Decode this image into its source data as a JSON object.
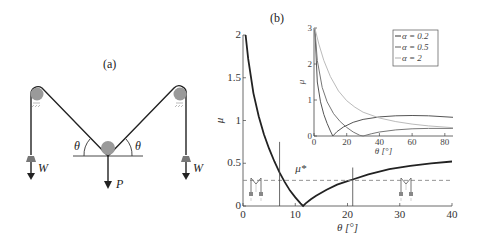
{
  "figure": {
    "panel_a_label": "(a)",
    "panel_b_label": "(b)"
  },
  "diagram_a": {
    "labels": {
      "theta_left": "θ",
      "theta_right": "θ",
      "weight_left": "W",
      "weight_right": "W",
      "load": "P"
    },
    "colors": {
      "pulley": "#9a9a9a",
      "rope": "#222222",
      "weight": "#777777"
    }
  },
  "chart_data": [
    {
      "type": "line",
      "title": "(b)",
      "xlabel": "θ [°]",
      "ylabel": "μ",
      "xlim": [
        0,
        40
      ],
      "ylim": [
        0,
        2
      ],
      "xticks": [
        0,
        10,
        20,
        30,
        40
      ],
      "yticks": [
        0,
        0.5,
        1,
        1.5,
        2
      ],
      "ytick_labels": [
        "0",
        "0.5",
        "1",
        "1.5",
        "2"
      ],
      "grid": false,
      "series": [
        {
          "name": "μ(θ)",
          "color": "#222222",
          "x": [
            0.5,
            1,
            2,
            3,
            4,
            5,
            6,
            7,
            8,
            9,
            10,
            11,
            11.5,
            12,
            13,
            14,
            16,
            18,
            20,
            21,
            24,
            28,
            32,
            36,
            40
          ],
          "y": [
            2.0,
            1.72,
            1.32,
            1.05,
            0.84,
            0.67,
            0.52,
            0.39,
            0.28,
            0.18,
            0.1,
            0.03,
            0.0,
            0.03,
            0.08,
            0.12,
            0.19,
            0.25,
            0.29,
            0.31,
            0.37,
            0.43,
            0.47,
            0.5,
            0.52
          ]
        }
      ],
      "annotations": [
        {
          "type": "hline",
          "y": 0.3,
          "style": "dashed",
          "label": "μ*",
          "color": "#888888"
        },
        {
          "type": "vline",
          "x": 7,
          "ymax": 0.75
        },
        {
          "type": "vline",
          "x": 21,
          "ymax": 0.45
        },
        {
          "type": "icon",
          "desc": "mini pulley diagram",
          "x": 3
        },
        {
          "type": "icon",
          "desc": "mini pulley diagram",
          "x": 30
        }
      ]
    },
    {
      "type": "line",
      "title": "inset",
      "xlabel": "θ [°]",
      "ylabel": "μ",
      "xlim": [
        0,
        85
      ],
      "ylim": [
        0,
        3
      ],
      "xticks": [
        0,
        20,
        40,
        60,
        80
      ],
      "yticks": [
        0,
        1,
        2,
        3
      ],
      "legend_position": "upper right",
      "series": [
        {
          "name": "α = 0.2",
          "color": "#555555",
          "x": [
            0.5,
            2,
            4,
            6,
            8,
            10,
            11.5,
            14,
            18,
            24,
            30,
            40,
            50,
            60,
            70,
            85
          ],
          "y": [
            3.0,
            1.5,
            0.95,
            0.6,
            0.35,
            0.14,
            0.0,
            0.12,
            0.25,
            0.38,
            0.46,
            0.53,
            0.56,
            0.57,
            0.56,
            0.52
          ]
        },
        {
          "name": "α = 0.5",
          "color": "#777777",
          "x": [
            0.5,
            2,
            5,
            8,
            12,
            16,
            20,
            24,
            28,
            30,
            35,
            40,
            50,
            60,
            70,
            85
          ],
          "y": [
            3.0,
            2.1,
            1.35,
            0.95,
            0.62,
            0.4,
            0.24,
            0.11,
            0.02,
            0.0,
            0.06,
            0.11,
            0.17,
            0.2,
            0.21,
            0.21
          ]
        },
        {
          "name": "α = 2",
          "color": "#bbbbbb",
          "x": [
            0.5,
            3,
            6,
            10,
            15,
            20,
            25,
            30,
            40,
            50,
            60,
            70,
            85
          ],
          "y": [
            3.0,
            2.55,
            2.1,
            1.65,
            1.25,
            0.98,
            0.8,
            0.66,
            0.5,
            0.4,
            0.33,
            0.28,
            0.23
          ]
        }
      ]
    }
  ]
}
